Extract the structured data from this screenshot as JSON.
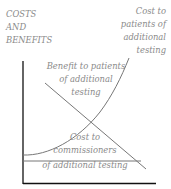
{
  "diagram": {
    "axis_label_lines": [
      "COSTS",
      "AND",
      "BENEFITS"
    ],
    "curves": [
      {
        "name": "Cost to patients of additional testing",
        "lines": [
          "Cost to",
          "patients of",
          "additional",
          "testing"
        ],
        "shape": "rising-curve"
      },
      {
        "name": "Benefit to patients of additional testing",
        "lines": [
          "Benefit to patients",
          "of additional",
          "testing"
        ],
        "shape": "falling-line"
      },
      {
        "name": "Cost to commissioners of additional testing",
        "lines": [
          "Cost to",
          "commissioners",
          "of additional testing"
        ],
        "shape": "flat-line"
      }
    ],
    "colors": {
      "axis": "#111111",
      "curves": "#777777",
      "text": "#8a8a8a"
    }
  }
}
